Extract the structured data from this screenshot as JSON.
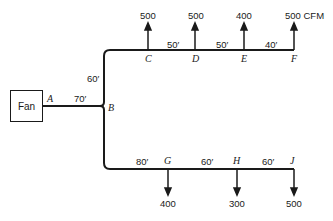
{
  "diagram": {
    "type": "duct-system",
    "fan_label": "Fan",
    "units": "CFM",
    "nodes": {
      "A": "A",
      "B": "B",
      "C": "C",
      "D": "D",
      "E": "E",
      "F": "F",
      "G": "G",
      "H": "H",
      "J": "J"
    },
    "segments": {
      "AB": "70′",
      "B_up": "60′",
      "CD": "50′",
      "DE": "50′",
      "EF": "40′",
      "B_to_G": "80′",
      "GH": "60′",
      "HJ": "60′"
    },
    "outlets": {
      "C": "500",
      "D": "500",
      "E": "400",
      "F": "500 CFM",
      "G": "400",
      "H": "300",
      "J": "500"
    },
    "colors": {
      "line": "#1a1a1a",
      "background": "#ffffff"
    }
  }
}
